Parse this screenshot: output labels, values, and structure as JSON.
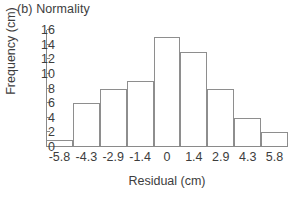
{
  "figure": {
    "panel_title": "(b) Normality",
    "background_color": "#ffffff",
    "bar_outline_color": "#8e8e8e",
    "bar_fill_color": "#ffffff",
    "axis_color": "#8a8a8a",
    "text_color": "#3d3d3d"
  },
  "chart_data": {
    "type": "bar",
    "title": "(b) Normality",
    "subtitle": "",
    "xlabel": "Residual (cm)",
    "ylabel": "Frequency (cm)",
    "categories": [
      "-5.8",
      "-4.3",
      "-2.9",
      "-1.4",
      "0",
      "1.4",
      "2.9",
      "4.3",
      "5.8"
    ],
    "values": [
      1,
      6,
      8,
      9,
      15,
      13,
      8,
      4,
      2
    ],
    "xlim": [
      -6.525,
      6.525
    ],
    "ylim": [
      0,
      16
    ],
    "yticks": [
      0,
      2,
      4,
      6,
      8,
      10,
      12,
      14,
      16
    ],
    "ytick_labels": [
      "0",
      "2",
      "4",
      "6",
      "8",
      "10",
      "12",
      "14",
      "16"
    ],
    "xtick_labels": [
      "-5.8",
      "-4.3",
      "-2.9",
      "-1.4",
      "0",
      "1.4",
      "2.9",
      "4.3",
      "5.8"
    ],
    "grid": false,
    "legend": null,
    "legend_position": "none",
    "bar_style": "unfilled outlined histogram bins",
    "annotations": []
  }
}
